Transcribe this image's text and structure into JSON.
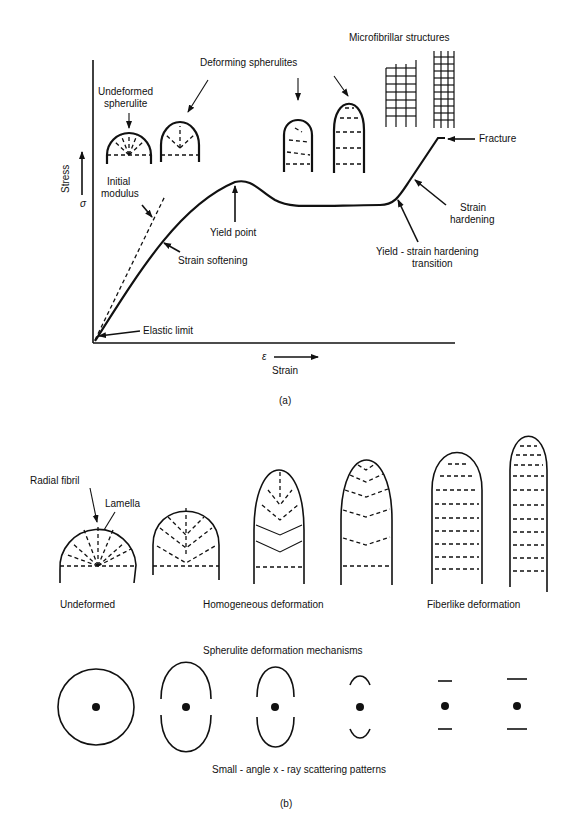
{
  "part_a": {
    "caption": "(a)",
    "y_axis": {
      "label": "Stress",
      "symbol": "σ"
    },
    "x_axis": {
      "label": "Strain",
      "symbol": "ε"
    },
    "labels": {
      "undeformed_line1": "Undeformed",
      "undeformed_line2": "spherulite",
      "deforming": "Deforming spherulites",
      "microfibrillar": "Microfibrillar structures",
      "fracture": "Fracture",
      "initial_line1": "Initial",
      "initial_line2": "modulus",
      "yield_point": "Yield point",
      "strain_softening": "Strain softening",
      "strain_hardening_line1": "Strain",
      "strain_hardening_line2": "hardening",
      "transition_line1": "Yield - strain hardening",
      "transition_line2": "transition",
      "elastic_limit": "Elastic limit"
    }
  },
  "part_b": {
    "caption": "(b)",
    "labels": {
      "radial_fibril": "Radial fibril",
      "lamella": "Lamella",
      "undeformed": "Undeformed",
      "homogeneous": "Homogeneous deformation",
      "fiberlike": "Fiberlike deformation",
      "mechanisms_title": "Spherulite deformation mechanisms",
      "saxs_title": "Small - angle x - ray scattering patterns"
    }
  }
}
